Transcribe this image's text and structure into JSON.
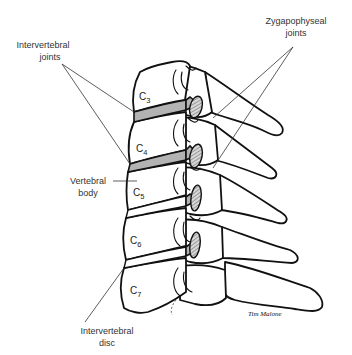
{
  "figure": {
    "colors": {
      "line": "#111111",
      "disc_fill": "#b3b3b3",
      "label_text": "#333333",
      "background": "#ffffff"
    }
  },
  "labels": {
    "intervertebral_joints": {
      "line1": "Intervertebral",
      "line2": "joints"
    },
    "zygapophyseal_joints": {
      "line1": "Zygapophyseal",
      "line2": "joints"
    },
    "vertebral_body": {
      "line1": "Vertebral",
      "line2": "body"
    },
    "intervertebral_disc": {
      "line1": "Intervertebral",
      "line2": "disc"
    }
  },
  "vertebrae": [
    {
      "letter": "C",
      "number": "3"
    },
    {
      "letter": "C",
      "number": "4"
    },
    {
      "letter": "C",
      "number": "5"
    },
    {
      "letter": "C",
      "number": "6"
    },
    {
      "letter": "C",
      "number": "7"
    }
  ],
  "signature": "Tim Malone"
}
